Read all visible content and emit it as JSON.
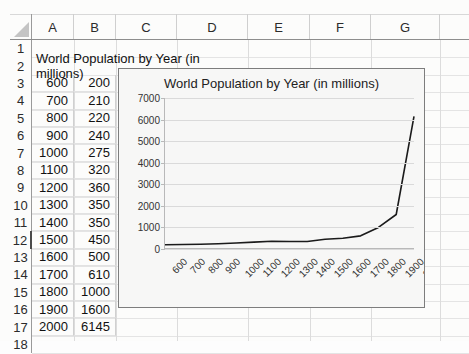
{
  "app": {
    "type": "spreadsheet"
  },
  "sheet": {
    "column_headers": [
      "A",
      "B",
      "C",
      "D",
      "E",
      "F",
      "G"
    ],
    "row_headers": [
      "1",
      "2",
      "3",
      "4",
      "5",
      "6",
      "7",
      "8",
      "9",
      "10",
      "11",
      "12",
      "13",
      "14",
      "15",
      "16",
      "17",
      "18"
    ],
    "active_row": "12",
    "select_all_icon": "select-all-triangle-icon",
    "title_cell": {
      "row": "2",
      "column": "A",
      "value": "World Population by Year (in millions)"
    },
    "data_rows": [
      {
        "row": "3",
        "a": "600",
        "b": "200"
      },
      {
        "row": "4",
        "a": "700",
        "b": "210"
      },
      {
        "row": "5",
        "a": "800",
        "b": "220"
      },
      {
        "row": "6",
        "a": "900",
        "b": "240"
      },
      {
        "row": "7",
        "a": "1000",
        "b": "275"
      },
      {
        "row": "8",
        "a": "1100",
        "b": "320"
      },
      {
        "row": "9",
        "a": "1200",
        "b": "360"
      },
      {
        "row": "10",
        "a": "1300",
        "b": "350"
      },
      {
        "row": "11",
        "a": "1400",
        "b": "350"
      },
      {
        "row": "12",
        "a": "1500",
        "b": "450"
      },
      {
        "row": "13",
        "a": "1600",
        "b": "500"
      },
      {
        "row": "14",
        "a": "1700",
        "b": "610"
      },
      {
        "row": "15",
        "a": "1800",
        "b": "1000"
      },
      {
        "row": "16",
        "a": "1900",
        "b": "1600"
      },
      {
        "row": "17",
        "a": "2000",
        "b": "6145"
      }
    ]
  },
  "chart_data": {
    "type": "line",
    "title": "World Population by Year (in millions)",
    "xlabel": "",
    "ylabel": "",
    "categories": [
      "600",
      "700",
      "800",
      "900",
      "1000",
      "1100",
      "1200",
      "1300",
      "1400",
      "1500",
      "1600",
      "1700",
      "1800",
      "1900",
      "2000"
    ],
    "values": [
      200,
      210,
      220,
      240,
      275,
      320,
      360,
      350,
      350,
      450,
      500,
      610,
      1000,
      1600,
      6145
    ],
    "ylim": [
      0,
      7000
    ],
    "yticks": [
      "0",
      "1000",
      "2000",
      "3000",
      "4000",
      "5000",
      "6000",
      "7000"
    ],
    "grid": true,
    "legend": "none",
    "line_color": "#1b1b1b"
  }
}
